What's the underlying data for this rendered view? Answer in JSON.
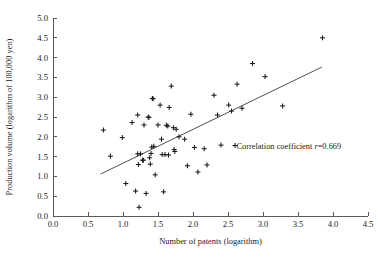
{
  "chart_data": {
    "type": "scatter",
    "title": "",
    "xlabel": "Number of patents (logarithm)",
    "ylabel": "Production volume (logarithm of 100,000 yen)",
    "xlim": [
      0.0,
      4.5
    ],
    "ylim": [
      0.0,
      5.0
    ],
    "xticks": [
      "0.0",
      "0.5",
      "1.0",
      "1.5",
      "2.0",
      "2.5",
      "3.0",
      "3.5",
      "4.0",
      "4.5"
    ],
    "yticks": [
      "0.0",
      "0.5",
      "1.0",
      "1.5",
      "2.0",
      "2.5",
      "3.0",
      "3.5",
      "4.0",
      "4.5",
      "5.0"
    ],
    "grid": false,
    "legend": "none",
    "marker": "plus",
    "marker_color": "#1a1a1a",
    "annotation": {
      "prefix": "Correlation coefficient ",
      "symbol": "r",
      "value": "=0.669",
      "full_text": "Correlation coefficient r=0.669",
      "x": 2.62,
      "y": 1.78
    },
    "trendline": {
      "label": "regression line",
      "x_start": 0.68,
      "y_start": 1.06,
      "x_end": 3.84,
      "y_end": 3.76,
      "color": "#3c3c3c"
    },
    "points": [
      {
        "x": 0.72,
        "y": 2.17
      },
      {
        "x": 0.82,
        "y": 1.51
      },
      {
        "x": 0.99,
        "y": 1.98
      },
      {
        "x": 1.04,
        "y": 0.82
      },
      {
        "x": 1.13,
        "y": 2.36
      },
      {
        "x": 1.18,
        "y": 0.63
      },
      {
        "x": 1.21,
        "y": 2.55
      },
      {
        "x": 1.21,
        "y": 1.57
      },
      {
        "x": 1.22,
        "y": 1.3
      },
      {
        "x": 1.23,
        "y": 0.22
      },
      {
        "x": 1.25,
        "y": 1.57
      },
      {
        "x": 1.28,
        "y": 1.41
      },
      {
        "x": 1.29,
        "y": 1.41
      },
      {
        "x": 1.3,
        "y": 2.3
      },
      {
        "x": 1.33,
        "y": 0.57
      },
      {
        "x": 1.36,
        "y": 2.5
      },
      {
        "x": 1.37,
        "y": 2.49
      },
      {
        "x": 1.38,
        "y": 1.47
      },
      {
        "x": 1.39,
        "y": 1.31
      },
      {
        "x": 1.4,
        "y": 1.58
      },
      {
        "x": 1.41,
        "y": 1.74
      },
      {
        "x": 1.42,
        "y": 2.97
      },
      {
        "x": 1.43,
        "y": 2.96
      },
      {
        "x": 1.44,
        "y": 1.76
      },
      {
        "x": 1.46,
        "y": 1.04
      },
      {
        "x": 1.5,
        "y": 2.3
      },
      {
        "x": 1.53,
        "y": 2.8
      },
      {
        "x": 1.55,
        "y": 1.94
      },
      {
        "x": 1.56,
        "y": 1.55
      },
      {
        "x": 1.58,
        "y": 0.61
      },
      {
        "x": 1.6,
        "y": 1.55
      },
      {
        "x": 1.62,
        "y": 2.29
      },
      {
        "x": 1.64,
        "y": 2.27
      },
      {
        "x": 1.65,
        "y": 1.54
      },
      {
        "x": 1.66,
        "y": 2.74
      },
      {
        "x": 1.69,
        "y": 3.28
      },
      {
        "x": 1.72,
        "y": 2.23
      },
      {
        "x": 1.73,
        "y": 1.68
      },
      {
        "x": 1.74,
        "y": 1.63
      },
      {
        "x": 1.76,
        "y": 2.19
      },
      {
        "x": 1.8,
        "y": 2.0
      },
      {
        "x": 1.88,
        "y": 1.94
      },
      {
        "x": 1.92,
        "y": 1.27
      },
      {
        "x": 1.97,
        "y": 2.57
      },
      {
        "x": 2.02,
        "y": 1.73
      },
      {
        "x": 2.07,
        "y": 1.11
      },
      {
        "x": 2.16,
        "y": 1.7
      },
      {
        "x": 2.2,
        "y": 1.29
      },
      {
        "x": 2.3,
        "y": 3.05
      },
      {
        "x": 2.35,
        "y": 2.55
      },
      {
        "x": 2.4,
        "y": 1.79
      },
      {
        "x": 2.51,
        "y": 2.8
      },
      {
        "x": 2.55,
        "y": 2.65
      },
      {
        "x": 2.6,
        "y": 1.78
      },
      {
        "x": 2.63,
        "y": 3.33
      },
      {
        "x": 2.7,
        "y": 2.72
      },
      {
        "x": 2.85,
        "y": 3.85
      },
      {
        "x": 3.03,
        "y": 3.52
      },
      {
        "x": 3.28,
        "y": 2.78
      },
      {
        "x": 3.85,
        "y": 4.5
      }
    ]
  },
  "axes": {
    "x_title": "Number of patents (logarithm)",
    "y_title": "Production volume (logarithm of 100,000 yen)"
  }
}
